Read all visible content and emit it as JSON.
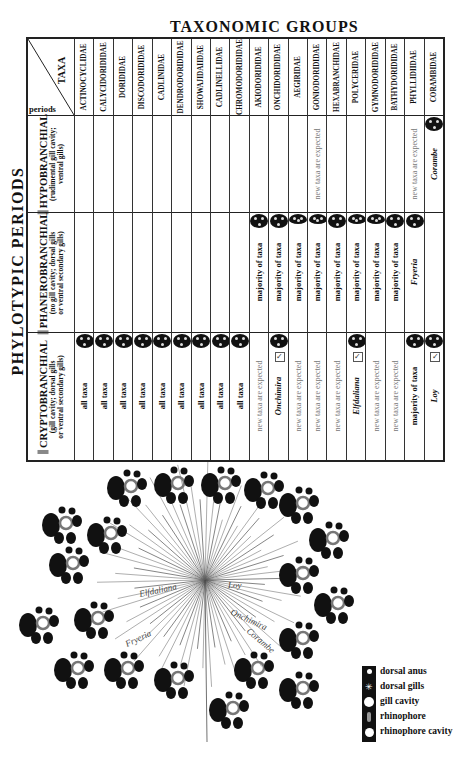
{
  "titles": {
    "top": "TAXONOMIC GROUPS",
    "left": "PHYLOTYPIC PERIODS"
  },
  "corner": {
    "taxa_label": "TAXA",
    "periods_label": "periods"
  },
  "taxa": [
    "ACTINOCYCLIDAE",
    "CALYCIDORIDIDAE",
    "DORIDIDAE",
    "DISCODORIDIDAE",
    "CADLINIDAE",
    "DENDRODORIDIDAE",
    "SHOWAJIDAIIDAE",
    "CADLINELLIDAE",
    "CHROMODORIDIDAE",
    "AKIODORIDIDAE",
    "ONCHIDORIDIDAE",
    "AEGIRIDAE",
    "GONIODORIDIDAE",
    "HEXABRANCHIDAE",
    "POLYCERIDAE",
    "GYMNODORIDIDAE",
    "BATHYDORIDIDAE",
    "PHYLLIDIIDAE",
    "CORAMBIDAE"
  ],
  "periods": [
    {
      "name": "HYPOBRANCHIAL",
      "desc1": "(rudimental gill cavity;",
      "desc2": "ventral gills)"
    },
    {
      "name": "PHANEROBRANCHIAL",
      "desc1": "(no gill cavity; dorsal gills",
      "desc2": "or ventral secondary gills)"
    },
    {
      "name": "CRYPTOBRANCHIAL",
      "desc1": "(gill cavity; dorsal gills",
      "desc2": "or ventral secondary gills)"
    }
  ],
  "cells": {
    "hypobranchial": [
      "",
      "",
      "",
      "",
      "",
      "",
      "",
      "",
      "",
      "",
      "",
      "",
      "new taxa are expected",
      "",
      "",
      "",
      "",
      "new taxa are expected",
      "Corambe"
    ],
    "phanerobranchial": [
      "",
      "",
      "",
      "",
      "",
      "",
      "",
      "",
      "",
      "majority of taxa",
      "majority of taxa",
      "majority of taxa",
      "majority of taxa",
      "majority of taxa",
      "majority of taxa",
      "majority of taxa",
      "majority of taxa",
      "Fryeria",
      ""
    ],
    "cryptobranchial": [
      "all taxa",
      "all taxa",
      "all taxa",
      "all taxa",
      "all taxa",
      "all taxa",
      "all taxa",
      "all taxa",
      "all taxa",
      "new taxa are expected",
      "Onchimira",
      "new taxa are expected",
      "new taxa are expected",
      "new taxa are expected",
      "Elfdaliana",
      "new taxa are expected",
      "new taxa are expected",
      "majority of taxa",
      "Loy"
    ]
  },
  "tree": {
    "labels": [
      "Elfdaliana",
      "Fryeria",
      "Loy",
      "Onchimira",
      "Corambe"
    ]
  },
  "legend": {
    "items": [
      "dorsal anus",
      "dorsal gills",
      "gill cavity",
      "rhinophore",
      "rhinophore cavity"
    ]
  }
}
